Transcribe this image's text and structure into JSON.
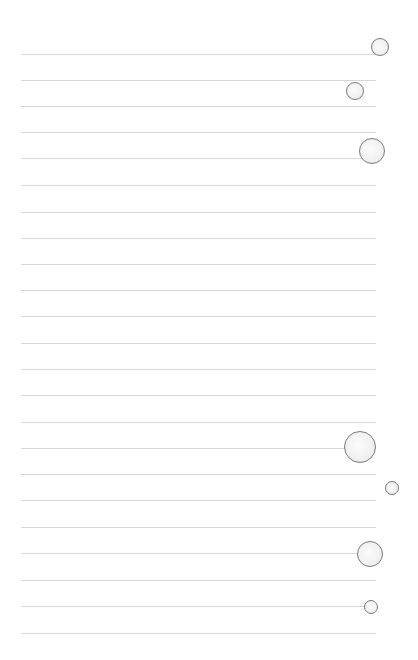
{
  "page": {
    "background": "#ffffff",
    "line_color": "#d6d6d6",
    "circle_stroke": "#7a7a7a",
    "circle_fill": "#f1f1f1"
  },
  "rules": {
    "x_start": 21,
    "x_end": 376,
    "y_positions": [
      54,
      80,
      106,
      132,
      158,
      185,
      212,
      238,
      264,
      290,
      316,
      343,
      369,
      395,
      422,
      448,
      474,
      500,
      527,
      553,
      580,
      606,
      633
    ]
  },
  "circles": [
    {
      "cx": 380,
      "cy": 47,
      "r": 9
    },
    {
      "cx": 355,
      "cy": 91,
      "r": 9
    },
    {
      "cx": 372,
      "cy": 151,
      "r": 13
    },
    {
      "cx": 360,
      "cy": 447,
      "r": 16
    },
    {
      "cx": 392,
      "cy": 488,
      "r": 7
    },
    {
      "cx": 370,
      "cy": 554,
      "r": 13
    },
    {
      "cx": 371,
      "cy": 607,
      "r": 7
    }
  ]
}
